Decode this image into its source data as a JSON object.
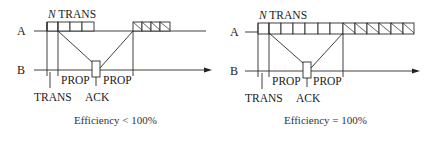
{
  "diagrams": [
    {
      "name": "efficiency-less-than-100",
      "station_a_label": "A",
      "station_b_label": "B",
      "window_label_n": "N",
      "window_label_trans": " TRANS",
      "trans_label": "TRANS",
      "prop_left_label": "PROP",
      "prop_right_label": "PROP",
      "ack_label": "ACK",
      "caption": "Efficiency < 100%",
      "sent_frames": 4,
      "idle_hatched_frames": 4
    },
    {
      "name": "efficiency-equal-100",
      "station_a_label": "A",
      "station_b_label": "B",
      "window_label_n": "N",
      "window_label_trans": " TRANS",
      "trans_label": "TRANS",
      "prop_left_label": "PROP",
      "prop_right_label": "PROP",
      "ack_label": "ACK",
      "caption": "Efficiency = 100%",
      "sent_frames": 7,
      "continued_hatched_frames": 6
    }
  ]
}
